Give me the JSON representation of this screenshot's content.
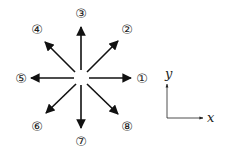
{
  "diagram": {
    "title": "",
    "center": {
      "x": 81,
      "y": 77
    },
    "directions": [
      {
        "id": 1,
        "label": "①",
        "angle_deg": 0,
        "name": "right"
      },
      {
        "id": 2,
        "label": "②",
        "angle_deg": 45,
        "name": "up-right"
      },
      {
        "id": 3,
        "label": "③",
        "angle_deg": 90,
        "name": "up"
      },
      {
        "id": 4,
        "label": "④",
        "angle_deg": 135,
        "name": "up-left"
      },
      {
        "id": 5,
        "label": "⑤",
        "angle_deg": 180,
        "name": "left"
      },
      {
        "id": 6,
        "label": "⑥",
        "angle_deg": 225,
        "name": "down-left"
      },
      {
        "id": 7,
        "label": "⑦",
        "angle_deg": 270,
        "name": "down"
      },
      {
        "id": 8,
        "label": "⑧",
        "angle_deg": 315,
        "name": "down-right"
      }
    ],
    "axes": {
      "x_label": "x",
      "y_label": "y"
    },
    "colors": {
      "stroke": "#111111",
      "background": "#ffffff"
    }
  }
}
